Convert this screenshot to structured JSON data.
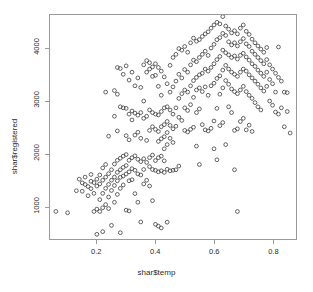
{
  "chart_data": {
    "type": "scatter",
    "title": "",
    "xlabel": "shar$temp",
    "ylabel": "shar$registered",
    "xlim": [
      0.04,
      0.88
    ],
    "ylim": [
      380,
      4650
    ],
    "grid": false,
    "legend": null,
    "marker": "open-circle",
    "marker_color": "#3d3d3d",
    "xticks": [
      0.2,
      0.4,
      0.6,
      0.8
    ],
    "xtick_labels": [
      "0.2",
      "0.4",
      "0.6",
      "0.8"
    ],
    "yticks": [
      1000,
      2000,
      3000,
      4000
    ],
    "ytick_labels": [
      "1000",
      "2000",
      "3000",
      "4000"
    ],
    "n_points": 320,
    "points": [
      [
        0.06,
        905
      ],
      [
        0.1,
        880
      ],
      [
        0.13,
        1300
      ],
      [
        0.14,
        1520
      ],
      [
        0.15,
        1450
      ],
      [
        0.15,
        1290
      ],
      [
        0.16,
        1420
      ],
      [
        0.16,
        1560
      ],
      [
        0.17,
        1380
      ],
      [
        0.17,
        1205
      ],
      [
        0.18,
        1480
      ],
      [
        0.18,
        1340
      ],
      [
        0.18,
        1610
      ],
      [
        0.19,
        1455
      ],
      [
        0.19,
        1250
      ],
      [
        0.19,
        905
      ],
      [
        0.2,
        1520
      ],
      [
        0.2,
        1390
      ],
      [
        0.2,
        950
      ],
      [
        0.2,
        470
      ],
      [
        0.21,
        1600
      ],
      [
        0.21,
        1430
      ],
      [
        0.21,
        1130
      ],
      [
        0.21,
        905
      ],
      [
        0.22,
        1735
      ],
      [
        0.22,
        1500
      ],
      [
        0.22,
        1250
      ],
      [
        0.22,
        975
      ],
      [
        0.22,
        520
      ],
      [
        0.23,
        3180
      ],
      [
        0.23,
        1800
      ],
      [
        0.23,
        1560
      ],
      [
        0.23,
        1345
      ],
      [
        0.23,
        1035
      ],
      [
        0.24,
        2340
      ],
      [
        0.24,
        1625
      ],
      [
        0.24,
        1420
      ],
      [
        0.24,
        1180
      ],
      [
        0.24,
        960
      ],
      [
        0.25,
        1700
      ],
      [
        0.25,
        1500
      ],
      [
        0.25,
        1305
      ],
      [
        0.25,
        640
      ],
      [
        0.26,
        3210
      ],
      [
        0.26,
        2720
      ],
      [
        0.26,
        1810
      ],
      [
        0.26,
        1560
      ],
      [
        0.26,
        1400
      ],
      [
        0.26,
        1080
      ],
      [
        0.27,
        3650
      ],
      [
        0.27,
        3140
      ],
      [
        0.27,
        2440
      ],
      [
        0.27,
        1880
      ],
      [
        0.27,
        1650
      ],
      [
        0.27,
        1490
      ],
      [
        0.27,
        1230
      ],
      [
        0.28,
        3630
      ],
      [
        0.28,
        2900
      ],
      [
        0.28,
        1920
      ],
      [
        0.28,
        1700
      ],
      [
        0.28,
        1555
      ],
      [
        0.28,
        1345
      ],
      [
        0.28,
        500
      ],
      [
        0.29,
        3520
      ],
      [
        0.29,
        2880
      ],
      [
        0.29,
        1960
      ],
      [
        0.29,
        1745
      ],
      [
        0.29,
        1580
      ],
      [
        0.29,
        1410
      ],
      [
        0.3,
        3680
      ],
      [
        0.3,
        2870
      ],
      [
        0.3,
        2350
      ],
      [
        0.3,
        1990
      ],
      [
        0.3,
        1780
      ],
      [
        0.3,
        1620
      ],
      [
        0.3,
        930
      ],
      [
        0.31,
        3410
      ],
      [
        0.31,
        2760
      ],
      [
        0.31,
        2270
      ],
      [
        0.31,
        1880
      ],
      [
        0.31,
        1660
      ],
      [
        0.31,
        1490
      ],
      [
        0.31,
        915
      ],
      [
        0.32,
        3560
      ],
      [
        0.32,
        2820
      ],
      [
        0.32,
        2650
      ],
      [
        0.32,
        1930
      ],
      [
        0.32,
        1720
      ],
      [
        0.32,
        1510
      ],
      [
        0.33,
        3300
      ],
      [
        0.33,
        2780
      ],
      [
        0.33,
        2360
      ],
      [
        0.33,
        1965
      ],
      [
        0.33,
        1690
      ],
      [
        0.33,
        1245
      ],
      [
        0.34,
        3450
      ],
      [
        0.34,
        2740
      ],
      [
        0.34,
        2415
      ],
      [
        0.34,
        1900
      ],
      [
        0.34,
        1620
      ],
      [
        0.34,
        1080
      ],
      [
        0.35,
        3270
      ],
      [
        0.35,
        2790
      ],
      [
        0.35,
        2300
      ],
      [
        0.35,
        1855
      ],
      [
        0.35,
        1600
      ],
      [
        0.35,
        705
      ],
      [
        0.36,
        3700
      ],
      [
        0.36,
        3010
      ],
      [
        0.36,
        2680
      ],
      [
        0.36,
        1910
      ],
      [
        0.36,
        1705
      ],
      [
        0.36,
        1430
      ],
      [
        0.37,
        3780
      ],
      [
        0.37,
        3560
      ],
      [
        0.37,
        2720
      ],
      [
        0.37,
        2260
      ],
      [
        0.37,
        1840
      ],
      [
        0.37,
        1500
      ],
      [
        0.38,
        3740
      ],
      [
        0.38,
        3620
      ],
      [
        0.38,
        2840
      ],
      [
        0.38,
        2450
      ],
      [
        0.38,
        1930
      ],
      [
        0.38,
        1760
      ],
      [
        0.38,
        1390
      ],
      [
        0.39,
        3660
      ],
      [
        0.39,
        3480
      ],
      [
        0.39,
        2790
      ],
      [
        0.39,
        2520
      ],
      [
        0.39,
        1980
      ],
      [
        0.39,
        1705
      ],
      [
        0.39,
        1110
      ],
      [
        0.4,
        3720
      ],
      [
        0.4,
        3500
      ],
      [
        0.4,
        2760
      ],
      [
        0.4,
        2470
      ],
      [
        0.4,
        1875
      ],
      [
        0.4,
        1690
      ],
      [
        0.4,
        660
      ],
      [
        0.41,
        3650
      ],
      [
        0.41,
        3290
      ],
      [
        0.41,
        2745
      ],
      [
        0.41,
        2430
      ],
      [
        0.41,
        2240
      ],
      [
        0.41,
        1930
      ],
      [
        0.41,
        1660
      ],
      [
        0.41,
        625
      ],
      [
        0.42,
        3580
      ],
      [
        0.42,
        3120
      ],
      [
        0.42,
        2810
      ],
      [
        0.42,
        2520
      ],
      [
        0.42,
        2290
      ],
      [
        0.42,
        1960
      ],
      [
        0.42,
        1680
      ],
      [
        0.42,
        590
      ],
      [
        0.43,
        3470
      ],
      [
        0.43,
        2880
      ],
      [
        0.43,
        2560
      ],
      [
        0.43,
        2330
      ],
      [
        0.43,
        2100
      ],
      [
        0.43,
        1870
      ],
      [
        0.43,
        1650
      ],
      [
        0.44,
        3340
      ],
      [
        0.44,
        2900
      ],
      [
        0.44,
        2620
      ],
      [
        0.44,
        2410
      ],
      [
        0.44,
        2180
      ],
      [
        0.44,
        1710
      ],
      [
        0.44,
        700
      ],
      [
        0.45,
        3690
      ],
      [
        0.45,
        3180
      ],
      [
        0.45,
        2840
      ],
      [
        0.45,
        2545
      ],
      [
        0.45,
        2300
      ],
      [
        0.45,
        1680
      ],
      [
        0.46,
        3840
      ],
      [
        0.46,
        3280
      ],
      [
        0.46,
        2760
      ],
      [
        0.46,
        2480
      ],
      [
        0.46,
        2220
      ],
      [
        0.46,
        1690
      ],
      [
        0.47,
        3900
      ],
      [
        0.47,
        3390
      ],
      [
        0.47,
        2880
      ],
      [
        0.47,
        2530
      ],
      [
        0.47,
        1700
      ],
      [
        0.48,
        4010
      ],
      [
        0.48,
        3520
      ],
      [
        0.48,
        3060
      ],
      [
        0.48,
        2700
      ],
      [
        0.48,
        1770
      ],
      [
        0.49,
        3980
      ],
      [
        0.49,
        3450
      ],
      [
        0.49,
        3150
      ],
      [
        0.49,
        2640
      ],
      [
        0.5,
        4050
      ],
      [
        0.5,
        3610
      ],
      [
        0.5,
        3220
      ],
      [
        0.5,
        2880
      ],
      [
        0.5,
        2450
      ],
      [
        0.51,
        3940
      ],
      [
        0.51,
        3560
      ],
      [
        0.51,
        3180
      ],
      [
        0.51,
        2830
      ],
      [
        0.51,
        2420
      ],
      [
        0.52,
        4120
      ],
      [
        0.52,
        3700
      ],
      [
        0.52,
        3300
      ],
      [
        0.52,
        2940
      ],
      [
        0.52,
        2470
      ],
      [
        0.53,
        4210
      ],
      [
        0.53,
        3790
      ],
      [
        0.53,
        3400
      ],
      [
        0.53,
        3080
      ],
      [
        0.53,
        2510
      ],
      [
        0.54,
        4150
      ],
      [
        0.54,
        3760
      ],
      [
        0.54,
        3460
      ],
      [
        0.54,
        3220
      ],
      [
        0.54,
        2790
      ],
      [
        0.54,
        2150
      ],
      [
        0.55,
        4180
      ],
      [
        0.55,
        3840
      ],
      [
        0.55,
        3510
      ],
      [
        0.55,
        3260
      ],
      [
        0.55,
        2860
      ],
      [
        0.55,
        1800
      ],
      [
        0.56,
        4240
      ],
      [
        0.56,
        3900
      ],
      [
        0.56,
        3540
      ],
      [
        0.56,
        3190
      ],
      [
        0.56,
        2560
      ],
      [
        0.57,
        4290
      ],
      [
        0.57,
        3960
      ],
      [
        0.57,
        3620
      ],
      [
        0.57,
        3280
      ],
      [
        0.57,
        2460
      ],
      [
        0.58,
        4330
      ],
      [
        0.58,
        3880
      ],
      [
        0.58,
        3580
      ],
      [
        0.58,
        3120
      ],
      [
        0.58,
        2440
      ],
      [
        0.59,
        4400
      ],
      [
        0.59,
        4020
      ],
      [
        0.59,
        3650
      ],
      [
        0.59,
        3300
      ],
      [
        0.59,
        2490
      ],
      [
        0.6,
        4460
      ],
      [
        0.6,
        4090
      ],
      [
        0.6,
        3720
      ],
      [
        0.6,
        3350
      ],
      [
        0.6,
        2630
      ],
      [
        0.6,
        2100
      ],
      [
        0.61,
        4510
      ],
      [
        0.61,
        4180
      ],
      [
        0.61,
        3800
      ],
      [
        0.61,
        3440
      ],
      [
        0.61,
        2870
      ],
      [
        0.61,
        1890
      ],
      [
        0.62,
        4480
      ],
      [
        0.62,
        4220
      ],
      [
        0.62,
        3860
      ],
      [
        0.62,
        3490
      ],
      [
        0.62,
        3140
      ],
      [
        0.62,
        2540
      ],
      [
        0.63,
        4620
      ],
      [
        0.63,
        4300
      ],
      [
        0.63,
        3980
      ],
      [
        0.63,
        3600
      ],
      [
        0.63,
        3260
      ],
      [
        0.63,
        2600
      ],
      [
        0.64,
        4440
      ],
      [
        0.64,
        4260
      ],
      [
        0.64,
        3930
      ],
      [
        0.64,
        3690
      ],
      [
        0.64,
        3400
      ],
      [
        0.64,
        2180
      ],
      [
        0.65,
        4380
      ],
      [
        0.65,
        4140
      ],
      [
        0.65,
        3890
      ],
      [
        0.65,
        3620
      ],
      [
        0.65,
        3330
      ],
      [
        0.65,
        2900
      ],
      [
        0.66,
        4310
      ],
      [
        0.66,
        4080
      ],
      [
        0.66,
        3840
      ],
      [
        0.66,
        3560
      ],
      [
        0.66,
        3240
      ],
      [
        0.66,
        2790
      ],
      [
        0.67,
        4350
      ],
      [
        0.67,
        4120
      ],
      [
        0.67,
        3870
      ],
      [
        0.67,
        3520
      ],
      [
        0.67,
        3190
      ],
      [
        0.67,
        2450
      ],
      [
        0.67,
        1700
      ],
      [
        0.68,
        4290
      ],
      [
        0.68,
        4060
      ],
      [
        0.68,
        3810
      ],
      [
        0.68,
        3480
      ],
      [
        0.68,
        3150
      ],
      [
        0.68,
        2480
      ],
      [
        0.68,
        905
      ],
      [
        0.69,
        4400
      ],
      [
        0.69,
        4140
      ],
      [
        0.69,
        3880
      ],
      [
        0.69,
        3560
      ],
      [
        0.69,
        3220
      ],
      [
        0.69,
        2620
      ],
      [
        0.7,
        4460
      ],
      [
        0.7,
        4200
      ],
      [
        0.7,
        3920
      ],
      [
        0.7,
        3620
      ],
      [
        0.7,
        3290
      ],
      [
        0.7,
        2680
      ],
      [
        0.71,
        4340
      ],
      [
        0.71,
        4100
      ],
      [
        0.71,
        3850
      ],
      [
        0.71,
        3580
      ],
      [
        0.71,
        3190
      ],
      [
        0.71,
        2460
      ],
      [
        0.72,
        4280
      ],
      [
        0.72,
        4050
      ],
      [
        0.72,
        3790
      ],
      [
        0.72,
        3510
      ],
      [
        0.72,
        3120
      ],
      [
        0.72,
        2550
      ],
      [
        0.73,
        4190
      ],
      [
        0.73,
        3960
      ],
      [
        0.73,
        3720
      ],
      [
        0.73,
        3450
      ],
      [
        0.73,
        3060
      ],
      [
        0.73,
        2430
      ],
      [
        0.74,
        4120
      ],
      [
        0.74,
        3900
      ],
      [
        0.74,
        3670
      ],
      [
        0.74,
        3390
      ],
      [
        0.74,
        2980
      ],
      [
        0.75,
        4060
      ],
      [
        0.75,
        3840
      ],
      [
        0.75,
        3600
      ],
      [
        0.75,
        3330
      ],
      [
        0.75,
        2900
      ],
      [
        0.76,
        4000
      ],
      [
        0.76,
        3780
      ],
      [
        0.76,
        3540
      ],
      [
        0.76,
        3260
      ],
      [
        0.76,
        2840
      ],
      [
        0.77,
        3940
      ],
      [
        0.77,
        3720
      ],
      [
        0.77,
        3480
      ],
      [
        0.77,
        3200
      ],
      [
        0.78,
        4030
      ],
      [
        0.78,
        3800
      ],
      [
        0.78,
        3560
      ],
      [
        0.78,
        3290
      ],
      [
        0.79,
        3700
      ],
      [
        0.79,
        3420
      ],
      [
        0.79,
        3010
      ],
      [
        0.8,
        3620
      ],
      [
        0.8,
        3340
      ],
      [
        0.8,
        2930
      ],
      [
        0.81,
        3540
      ],
      [
        0.81,
        3180
      ],
      [
        0.81,
        2800
      ],
      [
        0.82,
        4040
      ],
      [
        0.82,
        3460
      ],
      [
        0.82,
        2760
      ],
      [
        0.83,
        3390
      ],
      [
        0.83,
        2880
      ],
      [
        0.84,
        3180
      ],
      [
        0.84,
        2520
      ],
      [
        0.85,
        3170
      ],
      [
        0.85,
        2810
      ],
      [
        0.86,
        2400
      ]
    ]
  }
}
